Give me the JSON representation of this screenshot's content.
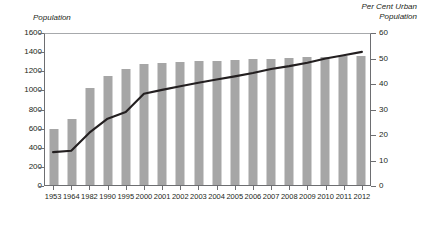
{
  "chart_data": {
    "type": "bar",
    "title": "",
    "xlabel": "",
    "ylabel": "Population",
    "y2label": "Per Cent Urban Population",
    "ylim": [
      0,
      1600
    ],
    "y2lim": [
      0,
      60
    ],
    "ytick_step": 200,
    "y2tick_step": 10,
    "grid": false,
    "legend_position": "inline-annotations",
    "categories": [
      "1953",
      "1964",
      "1982",
      "1990",
      "1995",
      "2000",
      "2001",
      "2002",
      "2003",
      "2004",
      "2005",
      "2006",
      "2007",
      "2008",
      "2009",
      "2010",
      "2011",
      "2012"
    ],
    "yticks": [
      "0",
      "200",
      "400",
      "600",
      "800",
      "1000",
      "1200",
      "1400",
      "1600"
    ],
    "y2ticks": [
      "0",
      "10",
      "20",
      "30",
      "40",
      "50",
      "60"
    ],
    "series": [
      {
        "name": "China's Total population",
        "type": "bar",
        "axis": "left",
        "color": "#a6a6a6",
        "values": [
          583,
          695,
          1017,
          1143,
          1211,
          1263,
          1276,
          1285,
          1292,
          1300,
          1308,
          1314,
          1321,
          1328,
          1335,
          1341,
          1347,
          1354
        ]
      },
      {
        "name": "Per Cent Urban Population (RHS)",
        "type": "line",
        "axis": "right",
        "color": "#231f20",
        "values": [
          13.3,
          13.8,
          20.9,
          26.4,
          29.0,
          36.2,
          37.7,
          39.1,
          40.5,
          41.8,
          43.0,
          44.3,
          45.9,
          47.0,
          48.3,
          50.0,
          51.3,
          52.6
        ]
      }
    ],
    "annotations": [
      {
        "name": "bar-series-annotation",
        "line1": "China's Total",
        "line2": "population"
      },
      {
        "name": "line-series-annotation",
        "line1": "Per Cent Urban",
        "line2": "Population (RHS)"
      }
    ],
    "axis_titles": {
      "left_line1": "Population",
      "right_line1": "Per Cent Urban",
      "right_line2": "Population"
    }
  }
}
